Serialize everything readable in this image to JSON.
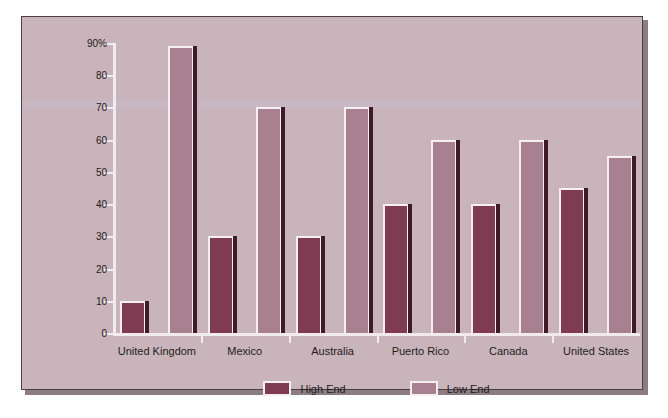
{
  "chart_data": {
    "type": "bar",
    "title": "",
    "xlabel": "",
    "ylabel": "",
    "ylim": [
      0,
      90
    ],
    "y_ticks": [
      "0",
      "10",
      "20",
      "30",
      "40",
      "50",
      "60",
      "70",
      "80",
      "90%"
    ],
    "grid": false,
    "legend_position": "bottom-center",
    "categories": [
      "United Kingdom",
      "Mexico",
      "Australia",
      "Puerto Rico",
      "Canada",
      "United States"
    ],
    "series": [
      {
        "name": "High End",
        "color": "#7e3b52",
        "values": [
          10,
          30,
          30,
          40,
          40,
          45
        ]
      },
      {
        "name": "Low End",
        "color": "#a8808f",
        "values": [
          89,
          70,
          70,
          60,
          60,
          55
        ]
      }
    ]
  },
  "legend": {
    "items": [
      {
        "label": "High End"
      },
      {
        "label": "Low End"
      }
    ]
  }
}
